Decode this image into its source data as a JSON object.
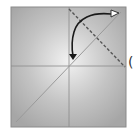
{
  "diagram": {
    "frame": {
      "x": 11,
      "y": 7,
      "width": 115,
      "height": 120,
      "fill_edge": "#a6a6a6",
      "fill_center": "#f2f2f2",
      "border": "#8a8a8a"
    },
    "axes": {
      "origin_x": 69,
      "origin_y": 66,
      "color": "#8c8c8c"
    },
    "diagonal_line": {
      "label": "y = x",
      "color": "#9a9a9a"
    },
    "dashed_line": {
      "label": "perpendicular",
      "color": "#555555"
    },
    "arrow": {
      "label": "rotation",
      "color": "#1a1a1a"
    },
    "side_text": "("
  }
}
